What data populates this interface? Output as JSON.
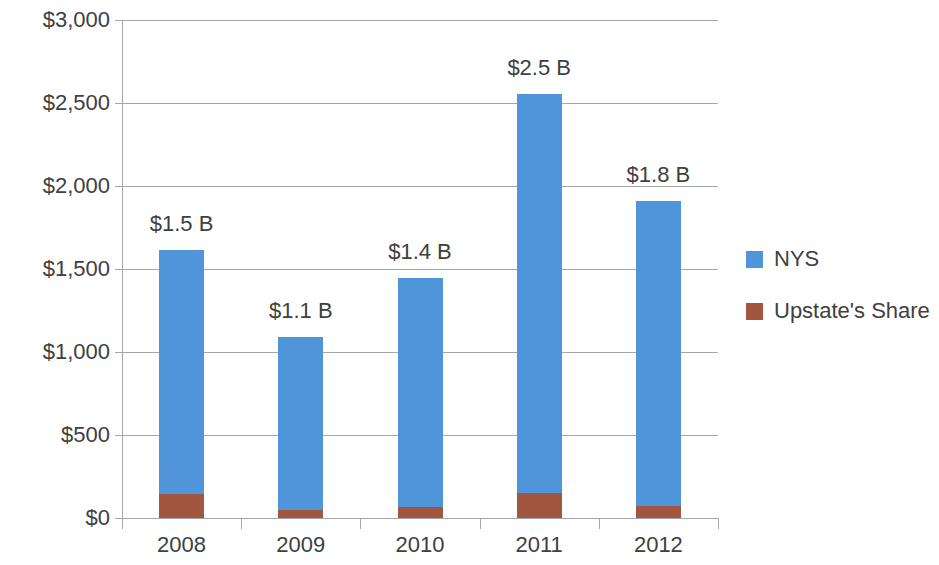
{
  "chart_data": {
    "type": "bar",
    "subtype": "stacked-column",
    "title": "",
    "xlabel": "",
    "ylabel": "",
    "categories": [
      "2008",
      "2009",
      "2010",
      "2011",
      "2012"
    ],
    "series": [
      {
        "name": "NYS",
        "color": "#4f95da",
        "values": [
          1470,
          1042,
          1379,
          2403,
          1838
        ]
      },
      {
        "name": "Upstate's Share",
        "color": "#a2553f",
        "values": [
          145,
          48,
          66,
          151,
          72
        ]
      }
    ],
    "totals": [
      1615,
      1090,
      1445,
      2554,
      1910
    ],
    "data_labels": [
      "$1.5 B",
      "$1.1 B",
      "$1.4 B",
      "$2.5 B",
      "$1.8 B"
    ],
    "ylim": [
      0,
      3000
    ],
    "ytick_values": [
      0,
      500,
      1000,
      1500,
      2000,
      2500,
      3000
    ],
    "ytick_labels": [
      "$0",
      "$500",
      "$1,000",
      "$1,500",
      "$2,000",
      "$2,500",
      "$3,000"
    ],
    "grid": true,
    "grid_axis": "y",
    "legend_position": "right",
    "legend": [
      {
        "label": "NYS",
        "color": "#4f95da"
      },
      {
        "label": "Upstate's Share",
        "color": "#a2553f"
      }
    ]
  }
}
